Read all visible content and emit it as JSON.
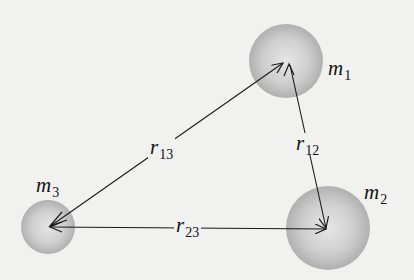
{
  "diagram": {
    "masses": [
      {
        "id": "m1",
        "symbol": "m",
        "subscript": "1",
        "cx": 286,
        "cy": 61,
        "r": 37
      },
      {
        "id": "m2",
        "symbol": "m",
        "subscript": "2",
        "cx": 328,
        "cy": 228,
        "r": 42
      },
      {
        "id": "m3",
        "symbol": "m",
        "subscript": "3",
        "cx": 48,
        "cy": 227,
        "r": 27
      }
    ],
    "distances": [
      {
        "id": "r12",
        "symbol": "r",
        "subscript": "12",
        "from": "m1",
        "to": "m2"
      },
      {
        "id": "r13",
        "symbol": "r",
        "subscript": "13",
        "from": "m1",
        "to": "m3"
      },
      {
        "id": "r23",
        "symbol": "r",
        "subscript": "23",
        "from": "m3",
        "to": "m2"
      }
    ],
    "colors": {
      "background": "#f1f1f0",
      "sphere_light": "#e4e4e4",
      "sphere_dark": "#a9a9a9",
      "line": "#1a1a1a"
    }
  }
}
